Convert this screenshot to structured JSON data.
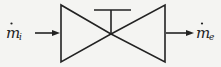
{
  "diagram": {
    "type": "throttling-valve",
    "inlet": {
      "symbol": "m",
      "dot": "˙",
      "subscript": "i"
    },
    "outlet": {
      "symbol": "m",
      "dot": "˙",
      "subscript": "e"
    },
    "colors": {
      "stroke": "#222222",
      "background": "#f4f4f2"
    }
  }
}
